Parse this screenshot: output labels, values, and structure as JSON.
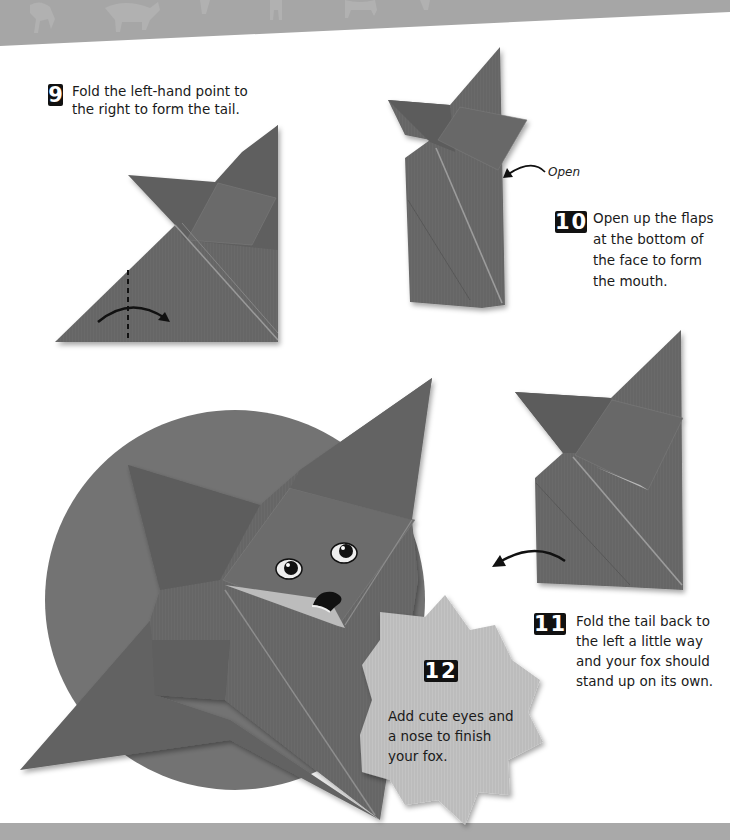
{
  "page": {
    "theme_colors": {
      "paper": "#666666",
      "paper_dark": "#5a5a5a",
      "circle": "#737373",
      "badge": "#bdbdbd",
      "banner": "#a6a6a6",
      "text": "#1a1a1a"
    }
  },
  "steps": [
    {
      "number": "9",
      "text": "Fold the left-hand point to\nthe right to form the tail."
    },
    {
      "number": "10",
      "text": "Open up the flaps\nat the bottom of\nthe face to form\nthe mouth."
    },
    {
      "number": "11",
      "text": "Fold the tail back to\nthe left a little way\nand your fox should\nstand up on its own."
    },
    {
      "number": "12",
      "text": "Add cute eyes and\na nose to finish\nyour fox."
    }
  ],
  "labels": {
    "open": "Open"
  },
  "icons": {
    "fold_arrow": "curved-arrow-right",
    "open_arrow": "curved-arrow-pointer",
    "tail_arrow": "curved-arrow-left"
  }
}
